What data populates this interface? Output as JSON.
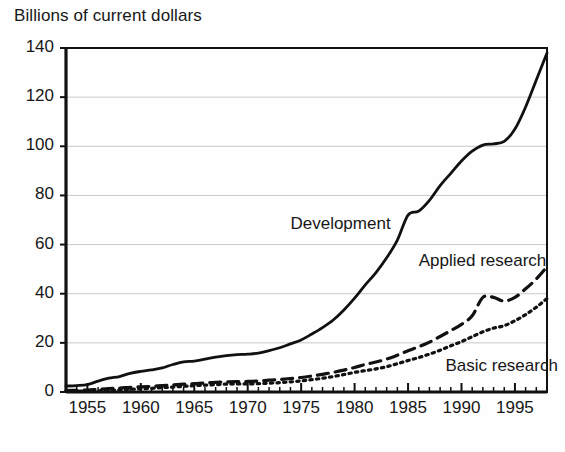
{
  "chart_data": {
    "type": "line",
    "title": "Billions of current dollars",
    "xlabel": "",
    "ylabel": "Billions of current dollars",
    "ylim": [
      0,
      140
    ],
    "xlim": [
      1953,
      1998
    ],
    "ytick_values": [
      0,
      20,
      40,
      60,
      80,
      100,
      120,
      140
    ],
    "ytick_labels": [
      "0",
      "20",
      "40",
      "60",
      "80",
      "100",
      "120",
      "140"
    ],
    "xtick_values": [
      1955,
      1960,
      1965,
      1970,
      1975,
      1980,
      1985,
      1990,
      1995
    ],
    "xtick_labels": [
      "1955",
      "1960",
      "1965",
      "1970",
      "1975",
      "1980",
      "1985",
      "1990",
      "1995"
    ],
    "minor_xticks": "every 1 year",
    "grid": "horizontal gridlines at each 20 unit y tick",
    "legend": "inline labels placed next to curves",
    "x": [
      1953,
      1954,
      1955,
      1956,
      1957,
      1958,
      1959,
      1960,
      1961,
      1962,
      1963,
      1964,
      1965,
      1966,
      1967,
      1968,
      1969,
      1970,
      1971,
      1972,
      1973,
      1974,
      1975,
      1976,
      1977,
      1978,
      1979,
      1980,
      1981,
      1982,
      1983,
      1984,
      1985,
      1986,
      1987,
      1988,
      1989,
      1990,
      1991,
      1992,
      1993,
      1994,
      1995,
      1996,
      1997,
      1998
    ],
    "series": [
      {
        "name": "Development",
        "style": "solid",
        "color": "#111111",
        "label_x": 1974.0,
        "label_y": 68,
        "values": [
          2.4,
          2.6,
          3.0,
          4.4,
          5.6,
          6.3,
          7.6,
          8.4,
          9.0,
          9.8,
          11.2,
          12.3,
          12.6,
          13.4,
          14.2,
          14.8,
          15.2,
          15.4,
          15.8,
          16.8,
          18.0,
          19.6,
          21.2,
          23.6,
          26.2,
          29.3,
          33.4,
          38.2,
          43.6,
          48.6,
          54.6,
          61.8,
          72.0,
          73.6,
          78.0,
          84.0,
          89.0,
          94.0,
          98.0,
          100.5,
          101.0,
          102.0,
          107.0,
          116.0,
          127.0,
          138.0
        ]
      },
      {
        "name": "Applied research",
        "style": "dashed",
        "color": "#111111",
        "label_x": 1986.0,
        "label_y": 53,
        "values": [
          0.6,
          0.7,
          0.8,
          1.1,
          1.4,
          1.6,
          1.9,
          2.1,
          2.3,
          2.6,
          2.9,
          3.2,
          3.4,
          3.7,
          3.9,
          4.1,
          4.2,
          4.3,
          4.5,
          4.8,
          5.1,
          5.5,
          5.9,
          6.5,
          7.2,
          8.0,
          8.9,
          10.0,
          11.2,
          12.2,
          13.4,
          15.0,
          16.8,
          18.4,
          20.3,
          22.6,
          25.0,
          27.5,
          31.0,
          38.5,
          38.5,
          37.0,
          38.5,
          42.0,
          46.0,
          51.0
        ]
      },
      {
        "name": "Basic research",
        "style": "dotted",
        "color": "#111111",
        "label_x": 1988.5,
        "label_y": 10,
        "values": [
          0.3,
          0.35,
          0.4,
          0.5,
          0.7,
          0.9,
          1.1,
          1.3,
          1.5,
          1.8,
          2.0,
          2.3,
          2.6,
          2.8,
          3.0,
          3.2,
          3.3,
          3.3,
          3.4,
          3.6,
          3.8,
          4.1,
          4.5,
          5.0,
          5.6,
          6.3,
          7.1,
          8.0,
          8.7,
          9.4,
          10.3,
          11.5,
          12.8,
          14.0,
          15.4,
          17.0,
          18.8,
          20.5,
          22.5,
          24.5,
          26.0,
          27.0,
          29.0,
          31.5,
          34.5,
          38.0
        ]
      }
    ]
  }
}
